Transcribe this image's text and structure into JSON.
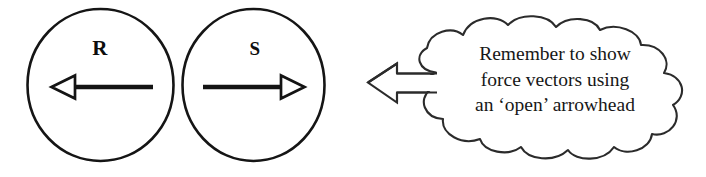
{
  "figure": {
    "type": "physics-free-body-diagram",
    "background_color": "#ffffff",
    "ink_color": "#141414"
  },
  "bodies": [
    {
      "id": "body-r",
      "label": "R",
      "shape": "circle",
      "force_vector": {
        "direction": "left",
        "arrowhead_style": "open"
      }
    },
    {
      "id": "body-s",
      "label": "S",
      "shape": "circle",
      "force_vector": {
        "direction": "right",
        "arrowhead_style": "open"
      }
    }
  ],
  "callout": {
    "shape": "cloud",
    "pointer_direction": "left",
    "pointer_style": "open-block-arrow",
    "lines": [
      "Remember to show",
      "force vectors using",
      "an ‘open’ arrowhead"
    ]
  }
}
